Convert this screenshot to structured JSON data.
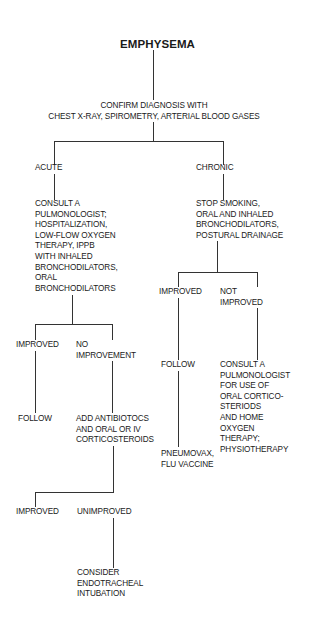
{
  "diagram": {
    "title": "EMPHYSEMA",
    "confirm": "CONFIRM DIAGNOSIS WITH\nCHEST X-RAY, SPIROMETRY, ARTERIAL BLOOD GASES",
    "acute": {
      "label": "ACUTE",
      "action": "CONSULT A\nPULMONOLOGIST;\nHOSPITALIZATION,\nLOW-FLOW OXYGEN\nTHERAPY, IPPB\nWITH INHALED\nBRONCHODILATORS,\nORAL\nBRONCHODILATORS",
      "improved": "IMPROVED",
      "improved_action": "FOLLOW",
      "no_improvement": "NO\nIMPROVEMENT",
      "no_improvement_action": "ADD ANTIBIOTOCS\nAND ORAL OR IV\nCORTICOSTEROIDS",
      "second_improved": "IMPROVED",
      "unimproved": "UNIMPROVED",
      "unimproved_action": "CONSIDER\nENDOTRACHEAL\nINTUBATION"
    },
    "chronic": {
      "label": "CHRONIC",
      "action": "STOP SMOKING,\nORAL AND INHALED\nBRONCHODILATORS,\nPOSTURAL DRAINAGE",
      "improved": "IMPROVED",
      "improved_action": "FOLLOW",
      "improved_followup": "PNEUMOVAX,\nFLU VACCINE",
      "not_improved": "NOT\nIMPROVED",
      "not_improved_action": "CONSULT A\nPULMONOLOGIST\nFOR USE OF\nORAL CORTICO-\nSTERIODS\nAND HOME\nOXYGEN\nTHERAPY;\nPHYSIOTHERAPY"
    }
  }
}
